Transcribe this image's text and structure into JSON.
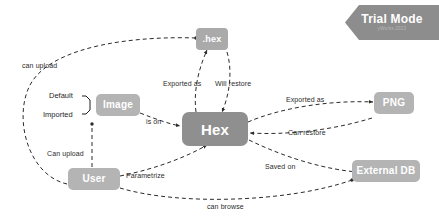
{
  "diagram": {
    "type": "graph",
    "title": "",
    "background": "#ffffff",
    "node_color": "#aaaaaa",
    "node_text_color": "#ffffff",
    "edge_color": "#2b2b2b",
    "label_color": "#2b2b2b"
  },
  "badge": {
    "label": "Trial Mode",
    "sublabel": "yWorks 2023",
    "color": "#8d8d8d"
  },
  "nodes": [
    {
      "id": "hexfile",
      "label": ".hex"
    },
    {
      "id": "image",
      "label": "Image"
    },
    {
      "id": "hex",
      "label": "Hex"
    },
    {
      "id": "png",
      "label": "PNG"
    },
    {
      "id": "user",
      "label": "User"
    },
    {
      "id": "externaldb",
      "label": "External DB"
    }
  ],
  "bracket_labels": [
    {
      "id": "default",
      "label": "Default"
    },
    {
      "id": "imported",
      "label": "Imported"
    }
  ],
  "edges": [
    {
      "id": "user-hexfile",
      "label": "can upload",
      "from": "user",
      "to": "hexfile"
    },
    {
      "id": "image-hexfile",
      "label": "Exported as",
      "from": "hex",
      "to": "hexfile"
    },
    {
      "id": "hexfile-hex",
      "label": "Will restore",
      "from": "hexfile",
      "to": "hex"
    },
    {
      "id": "image-hex",
      "label": "is on",
      "from": "image",
      "to": "hex"
    },
    {
      "id": "user-image",
      "label": "Can upload",
      "from": "user",
      "to": "image"
    },
    {
      "id": "hex-png",
      "label": "Exported as",
      "from": "hex",
      "to": "png"
    },
    {
      "id": "png-hex",
      "label": "Can restore",
      "from": "png",
      "to": "hex"
    },
    {
      "id": "hex-db",
      "label": "Saved on",
      "from": "hex",
      "to": "externaldb"
    },
    {
      "id": "user-hex",
      "label": "Parametrize",
      "from": "user",
      "to": "hex"
    },
    {
      "id": "user-db",
      "label": "can browse",
      "from": "user",
      "to": "externaldb"
    }
  ]
}
